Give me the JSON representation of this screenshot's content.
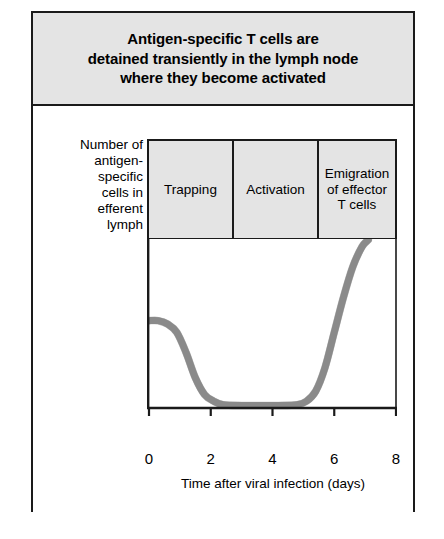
{
  "title": {
    "lines": [
      "Antigen-specific T cells are",
      "detained transiently in the lymph node",
      "where they become activated"
    ]
  },
  "chart_panel": {
    "y_axis_label_lines": [
      "Number of",
      "antigen-",
      "specific",
      "cells in",
      "efferent",
      "lymph"
    ],
    "phases": [
      {
        "lines": [
          "Trapping"
        ]
      },
      {
        "lines": [
          "Activation"
        ]
      },
      {
        "lines": [
          "Emigration",
          "of effector",
          "T cells"
        ]
      }
    ],
    "x_label": "Time after viral infection (days)"
  },
  "colors": {
    "panel_background": "#e4e4e4",
    "frame": "#1a1a1a",
    "curve_fill": "#8a8a8a",
    "curve_stroke": "#4d4d4d",
    "plot_background": "#ffffff"
  },
  "chart_data": {
    "type": "line",
    "title": "Antigen-specific T cells are detained transiently in the lymph node where they become activated",
    "xlabel": "Time after viral infection (days)",
    "ylabel": "Number of antigen-specific cells in efferent lymph",
    "xlim": [
      0,
      8
    ],
    "ylim": [
      0,
      100
    ],
    "xticks": [
      0,
      2,
      4,
      6,
      8
    ],
    "xticklabels": [
      "0",
      "2",
      "4",
      "6",
      "8"
    ],
    "yticks": [],
    "yticklabels": [],
    "grid": false,
    "legend": false,
    "series": [
      {
        "name": "Antigen-specific cells in efferent lymph",
        "color": "#8a8a8a",
        "x": [
          0.0,
          0.3,
          0.6,
          0.9,
          1.2,
          1.5,
          1.8,
          2.1,
          2.4,
          3.0,
          3.6,
          4.2,
          4.8,
          5.1,
          5.4,
          5.7,
          6.0,
          6.3,
          6.6,
          6.9,
          7.1
        ],
        "y": [
          52,
          52,
          50,
          45,
          33,
          18,
          8,
          4,
          2,
          1.5,
          1.5,
          1.5,
          2,
          4,
          10,
          24,
          45,
          66,
          84,
          96,
          100
        ]
      }
    ],
    "annotations": [
      {
        "text": "Trapping",
        "x_range": [
          0,
          2.7
        ]
      },
      {
        "text": "Activation",
        "x_range": [
          2.7,
          5.5
        ]
      },
      {
        "text": "Emigration of effector T cells",
        "x_range": [
          5.5,
          8
        ]
      }
    ]
  }
}
